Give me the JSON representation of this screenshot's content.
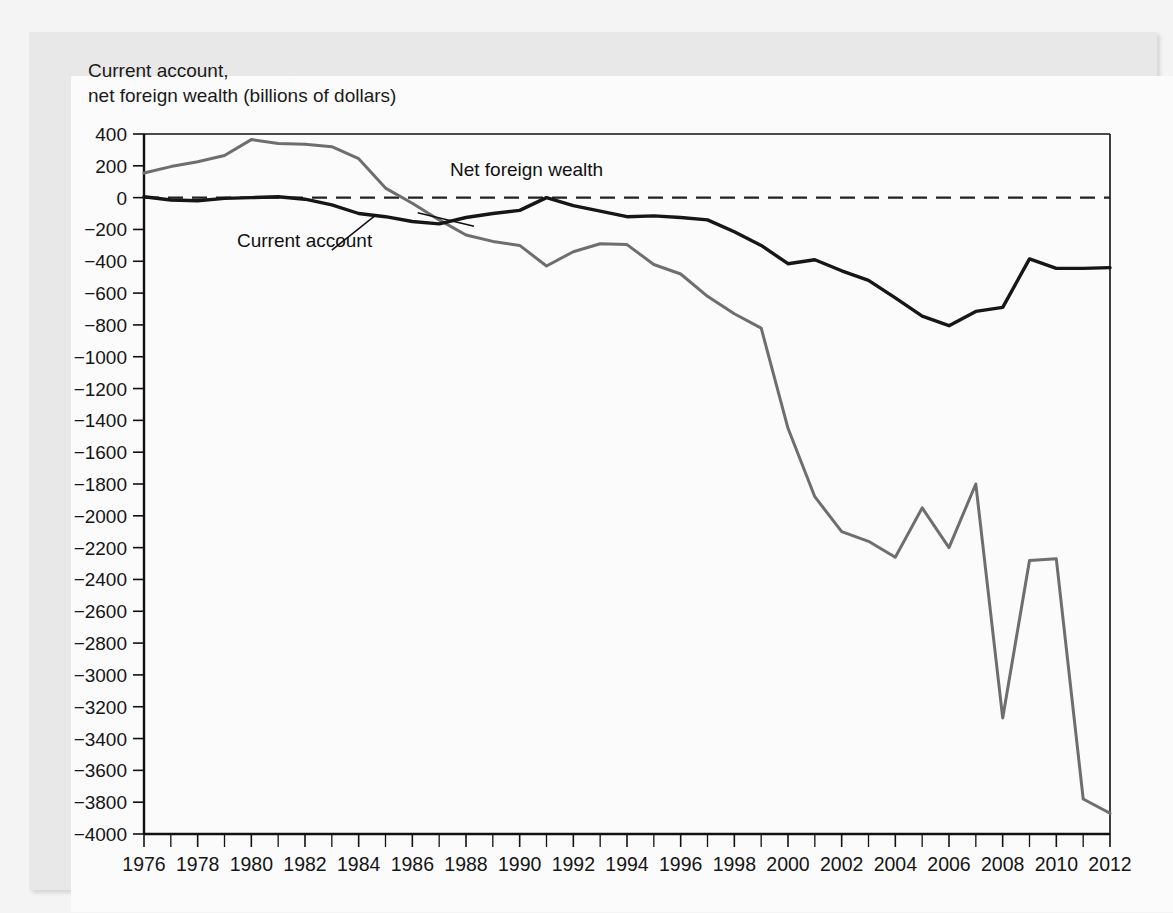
{
  "figure": {
    "axis_caption": "Current account,\nnet foreign wealth (billions of dollars)",
    "annotations": {
      "net_foreign_wealth": "Net foreign wealth",
      "current_account": "Current account"
    }
  },
  "colors": {
    "current_account_line": "#161616",
    "net_foreign_wealth_line": "#6e6e6e",
    "zero_line": "#222222",
    "axis": "#111111",
    "plot_background": "#fbfbfb",
    "frame": "#e8e8e8"
  },
  "bleed_text": [
    "than a century ago, in 1837. The country was a net foreign debtor, and",
    "most of the borrowed money went into railroad construction and other",
    "investments that did not generate enough in earnings to pay back the debt",
    "that had financed them. In the late 1980s the United States once",
    "again became a net foreign debtor.",
    "Equation (2) says a nation's current account is equal to the change",
    "in its net foreign wealth, but this relation is not a coincidence.",
    "It is quite clear that a country that generates new international wealth",
    "has a current account surplus equal to the addition to its holdings.",
    "A country with a current account deficit must be selling assets abroad.",
    "Such transactions were to be explained more completely in Chapter 13.",
    "A current account deficit is therefore the rate at which a country runs",
    "down its foreign wealth, borrowing against its future earnings.",
    "The value of net foreign wealth can change for reasons other than",
    "saving and investment flows. Capital gains and losses on existing assets",
    "also matter, as do write-offs of bad debts and fluctuations in exchange",
    "rates. Such valuation effects can be quite large in practice.",
    "Accordingly, a nation's wealth measured at current market prices need",
    "not equal the cumulated sum of past current account balances."
  ],
  "chart_data": {
    "type": "line",
    "title": "",
    "xlabel": "",
    "ylabel": "Current account, net foreign wealth (billions of dollars)",
    "xlim": [
      1976,
      2012
    ],
    "ylim": [
      -4000,
      400
    ],
    "y_ticks": [
      400,
      200,
      0,
      -200,
      -400,
      -600,
      -800,
      -1000,
      -1200,
      -1400,
      -1600,
      -1800,
      -2000,
      -2200,
      -2400,
      -2600,
      -2800,
      -3000,
      -3200,
      -3400,
      -3600,
      -3800,
      -4000
    ],
    "x_ticks": [
      1976,
      1978,
      1980,
      1982,
      1984,
      1986,
      1988,
      1990,
      1992,
      1994,
      1996,
      1998,
      2000,
      2002,
      2004,
      2006,
      2008,
      2010,
      2012
    ],
    "x_tick_step_minor": 1,
    "grid": false,
    "legend_position": "inline-annotations",
    "x": [
      1976,
      1977,
      1978,
      1979,
      1980,
      1981,
      1982,
      1983,
      1984,
      1985,
      1986,
      1987,
      1988,
      1989,
      1990,
      1991,
      1992,
      1993,
      1994,
      1995,
      1996,
      1997,
      1998,
      1999,
      2000,
      2001,
      2002,
      2003,
      2004,
      2005,
      2006,
      2007,
      2008,
      2009,
      2010,
      2011,
      2012
    ],
    "series": [
      {
        "name": "Net foreign wealth",
        "color": "#6e6e6e",
        "values": [
          155,
          195,
          225,
          265,
          365,
          340,
          335,
          320,
          245,
          60,
          -35,
          -140,
          -235,
          -275,
          -300,
          -430,
          -340,
          -290,
          -295,
          -420,
          -480,
          -620,
          -730,
          -820,
          -1450,
          -1880,
          -2100,
          -2160,
          -2260,
          -1950,
          -2200,
          -1800,
          -3270,
          -2280,
          -2270,
          -3780,
          -3870
        ]
      },
      {
        "name": "Current account",
        "color": "#161616",
        "values": [
          5,
          -15,
          -20,
          -5,
          0,
          5,
          -10,
          -45,
          -100,
          -120,
          -150,
          -165,
          -125,
          -100,
          -80,
          0,
          -50,
          -85,
          -120,
          -115,
          -125,
          -140,
          -215,
          -300,
          -415,
          -390,
          -460,
          -520,
          -630,
          -745,
          -805,
          -715,
          -690,
          -385,
          -445,
          -445,
          -440
        ]
      }
    ]
  }
}
